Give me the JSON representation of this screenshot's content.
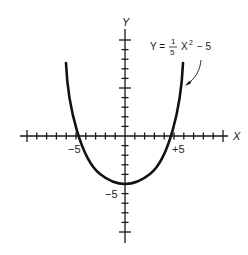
{
  "chart_data": {
    "type": "line",
    "title": "",
    "equation": {
      "lhs": "Y =",
      "frac_num": "1",
      "frac_den": "5",
      "var": "X",
      "exp": "2",
      "tail": "− 5"
    },
    "xlabel": "X",
    "ylabel": "Y",
    "xlim": [
      -10,
      10
    ],
    "ylim": [
      -10,
      10
    ],
    "x_tick_labels": [
      "−5",
      "+5"
    ],
    "y_tick_labels": [
      "−5"
    ],
    "grid": false,
    "series": [
      {
        "name": "Y = (1/5)X^2 - 5",
        "x": [
          -6,
          -5,
          -4,
          -3,
          -2,
          -1,
          0,
          1,
          2,
          3,
          4,
          5,
          6
        ],
        "y": [
          2.2,
          0,
          -1.8,
          -3.2,
          -4.2,
          -4.8,
          -5,
          -4.8,
          -4.2,
          -3.2,
          -1.8,
          0,
          2.2
        ]
      }
    ],
    "annotations": [
      {
        "text": "Y = 1/5 X² − 5",
        "points_to": "right branch of parabola"
      }
    ]
  },
  "colors": {
    "ink": "#1a1a1a",
    "background": "#ffffff"
  }
}
